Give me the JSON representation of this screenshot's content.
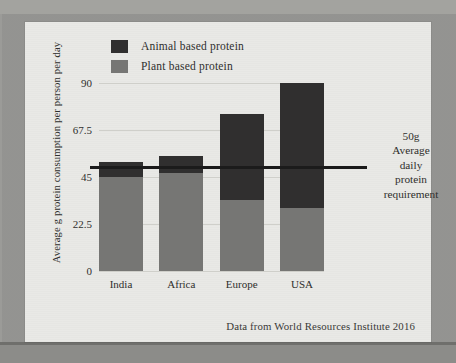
{
  "figure": {
    "source_note": "Data from World Resources Institute   2016"
  },
  "legend": {
    "items": [
      {
        "label": "Animal based protein",
        "color": "#302f2f",
        "key": "animal"
      },
      {
        "label": "Plant based protein",
        "color": "#767674",
        "key": "plant"
      }
    ]
  },
  "annotation": {
    "reference_line": {
      "value": 50,
      "lines": [
        "50g",
        "Average",
        "daily",
        "protein",
        "requirement"
      ],
      "text": "50g Average daily protein requirement",
      "color": "#1b1b1b"
    }
  },
  "chart_data": {
    "type": "bar",
    "subtype": "stacked-bar",
    "title": "",
    "xlabel": "",
    "ylabel": "Average g protein consumption per person per day",
    "categories": [
      "India",
      "Africa",
      "Europe",
      "USA"
    ],
    "series": [
      {
        "name": "Plant based protein",
        "color": "#767674",
        "values": [
          45,
          47,
          34,
          30
        ]
      },
      {
        "name": "Animal based protein",
        "color": "#302f2f",
        "values": [
          7,
          8,
          41,
          60
        ]
      }
    ],
    "totals": [
      52,
      55,
      75,
      90
    ],
    "ylim": [
      0,
      90
    ],
    "yticks": [
      0,
      22.5,
      45,
      67.5,
      90
    ],
    "ytick_labels": [
      "0",
      "22.5",
      "45",
      "67.5",
      "90"
    ],
    "grid": true,
    "legend_position": "top-left",
    "reference_lines": [
      {
        "value": 50,
        "label": "50g Average daily protein requirement",
        "color": "#1b1b1b"
      }
    ],
    "source": "Data from World Resources Institute   2016",
    "units": "g protein per person per day"
  }
}
